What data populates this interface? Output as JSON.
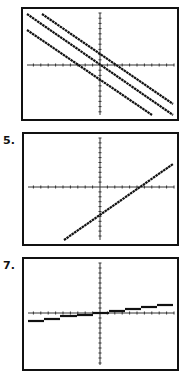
{
  "labels": {
    "graph2": "5.",
    "graph3": "7."
  },
  "chart_data": [
    {
      "type": "line",
      "title": "",
      "description": "Three parallel lines with negative slope; middle passes through origin",
      "xlim": [
        -10,
        10
      ],
      "ylim": [
        -10,
        10
      ],
      "grid": false,
      "frame": {
        "x": 22,
        "y": 8,
        "w": 156,
        "h": 112
      },
      "origin_px": [
        100,
        65
      ],
      "series": [
        {
          "name": "upper",
          "points": [
            [
              42,
              14
            ],
            [
              173,
              104
            ]
          ]
        },
        {
          "name": "middle",
          "points": [
            [
              27,
              14
            ],
            [
              173,
              115
            ]
          ]
        },
        {
          "name": "lower",
          "points": [
            [
              27,
              30
            ],
            [
              152,
              115
            ]
          ]
        }
      ]
    },
    {
      "type": "line",
      "label": "5.",
      "description": "Single line with positive slope, negative y-intercept",
      "xlim": [
        -10,
        10
      ],
      "ylim": [
        -10,
        10
      ],
      "grid": false,
      "frame": {
        "x": 23,
        "y": 133,
        "w": 155,
        "h": 112
      },
      "origin_px": [
        100,
        187
      ],
      "series": [
        {
          "name": "line",
          "points": [
            [
              64,
              240
            ],
            [
              173,
              164
            ]
          ]
        }
      ]
    },
    {
      "type": "line",
      "label": "7.",
      "description": "Step function (greatest integer) with small positive trend",
      "xlim": [
        -10,
        10
      ],
      "ylim": [
        -10,
        10
      ],
      "grid": false,
      "frame": {
        "x": 23,
        "y": 258,
        "w": 155,
        "h": 112
      },
      "origin_px": [
        100,
        313
      ],
      "series": [
        {
          "name": "steps",
          "segments": [
            [
              28,
              44,
              321
            ],
            [
              44,
              60,
              319
            ],
            [
              60,
              77,
              316
            ],
            [
              77,
              93,
              315
            ],
            [
              93,
              109,
              313
            ],
            [
              109,
              125,
              311
            ],
            [
              125,
              141,
              309
            ],
            [
              141,
              157,
              307
            ],
            [
              157,
              173,
              305
            ]
          ]
        }
      ]
    }
  ]
}
